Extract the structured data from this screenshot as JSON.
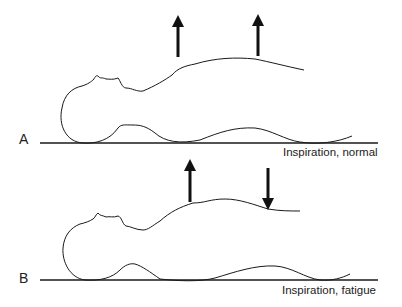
{
  "figure": {
    "panels": [
      {
        "letter": "A",
        "caption": "Inspiration, normal",
        "arrows": [
          {
            "direction": "up",
            "position": "upper chest"
          },
          {
            "direction": "up",
            "position": "abdomen"
          }
        ]
      },
      {
        "letter": "B",
        "caption": "Inspiration, fatigue",
        "arrows": [
          {
            "direction": "up",
            "position": "upper chest"
          },
          {
            "direction": "down",
            "position": "abdomen"
          }
        ]
      }
    ],
    "colors": {
      "line": "#1a1a1a",
      "background": "#ffffff"
    }
  }
}
